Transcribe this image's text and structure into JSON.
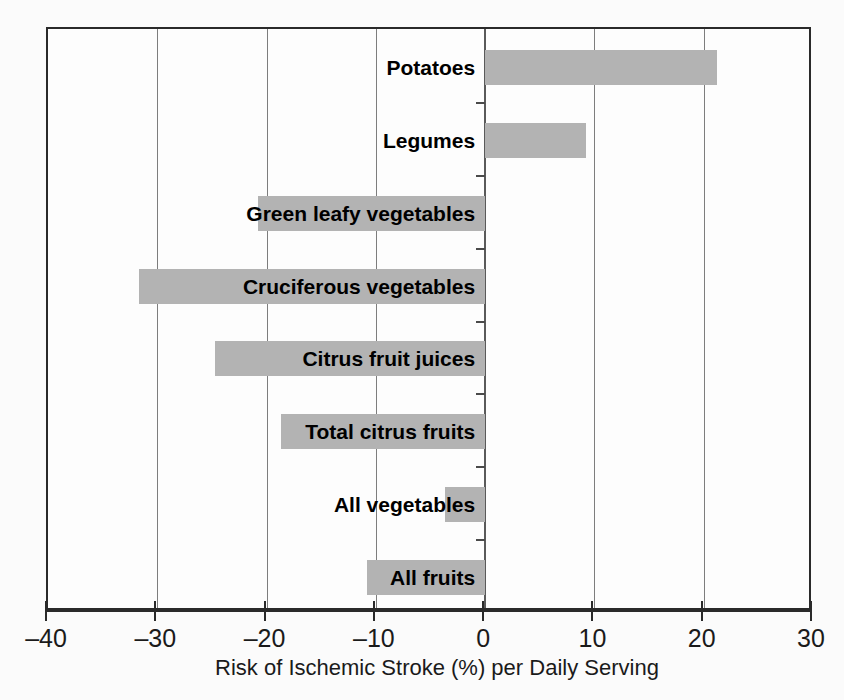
{
  "chart_data": {
    "type": "bar",
    "orientation": "horizontal",
    "title": "",
    "xlabel": "Risk of Ischemic Stroke (%) per Daily Serving",
    "ylabel": "",
    "xlim": [
      -40,
      30
    ],
    "xticks": [
      -40,
      -30,
      -20,
      -10,
      0,
      10,
      20,
      30
    ],
    "xticklabels": [
      "–40",
      "–30",
      "–20",
      "–10",
      "0",
      "10",
      "20",
      "30"
    ],
    "grid": "vertical",
    "legend": "none",
    "bar_color": "#b3b3b3",
    "categories": [
      "Potatoes",
      "Legumes",
      "Green leafy vegetables",
      "Cruciferous vegetables",
      "Citrus fruit juices",
      "Total citrus fruits",
      "All vegetables",
      "All fruits"
    ],
    "values": [
      21.2,
      9.2,
      -20.8,
      -31.7,
      -24.7,
      -18.7,
      -3.7,
      -10.8
    ]
  },
  "axis": {
    "title": "Risk of Ischemic Stroke (%) per Daily Serving"
  }
}
